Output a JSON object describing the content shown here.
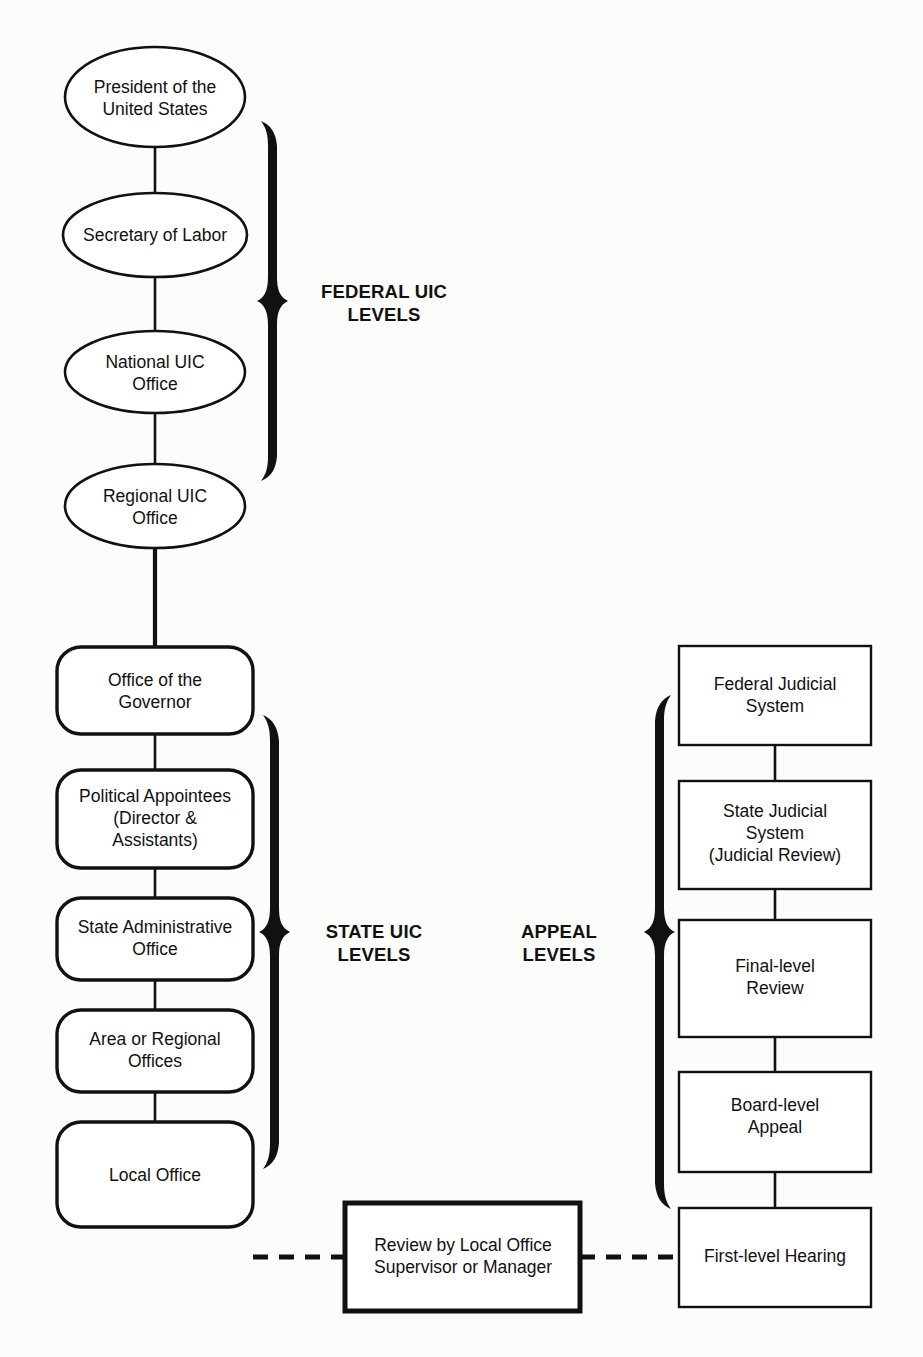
{
  "diagram": {
    "background_color": "#fcfcfb",
    "line_color": "#111111",
    "fill_color": "#ffffff"
  },
  "federal_column": {
    "group_label_line1": "FEDERAL UIC",
    "group_label_line2": "LEVELS",
    "nodes": [
      {
        "id": "president",
        "line1": "President of the",
        "line2": "United States",
        "shape": "ellipse"
      },
      {
        "id": "secretary-of-labor",
        "line1": "Secretary of Labor",
        "line2": "",
        "shape": "ellipse"
      },
      {
        "id": "national-uic-office",
        "line1": "National UIC",
        "line2": "Office",
        "shape": "ellipse"
      },
      {
        "id": "regional-uic-office",
        "line1": "Regional UIC",
        "line2": "Office",
        "shape": "ellipse"
      }
    ]
  },
  "state_column": {
    "group_label_line1": "STATE UIC",
    "group_label_line2": "LEVELS",
    "nodes": [
      {
        "id": "office-of-the-governor",
        "line1": "Office of the",
        "line2": "Governor",
        "line3": "",
        "shape": "rounded-rect"
      },
      {
        "id": "political-appointees",
        "line1": "Political Appointees",
        "line2": "(Director &",
        "line3": "Assistants)",
        "shape": "rounded-rect"
      },
      {
        "id": "state-administrative-office",
        "line1": "State Administrative",
        "line2": "Office",
        "line3": "",
        "shape": "rounded-rect"
      },
      {
        "id": "area-or-regional-offices",
        "line1": "Area or Regional",
        "line2": "Offices",
        "line3": "",
        "shape": "rounded-rect"
      },
      {
        "id": "local-office",
        "line1": "Local Office",
        "line2": "",
        "line3": "",
        "shape": "rounded-rect"
      }
    ]
  },
  "appeal_column": {
    "group_label_line1": "APPEAL",
    "group_label_line2": "LEVELS",
    "nodes": [
      {
        "id": "federal-judicial-system",
        "line1": "Federal Judicial",
        "line2": "System",
        "line3": "",
        "shape": "rect"
      },
      {
        "id": "state-judicial-system",
        "line1": "State Judicial",
        "line2": "System",
        "line3": "(Judicial Review)",
        "shape": "rect"
      },
      {
        "id": "final-level-review",
        "line1": "Final-level",
        "line2": "Review",
        "line3": "",
        "shape": "rect"
      },
      {
        "id": "board-level-appeal",
        "line1": "Board-level",
        "line2": "Appeal",
        "line3": "",
        "shape": "rect"
      },
      {
        "id": "first-level-hearing",
        "line1": "First-level Hearing",
        "line2": "",
        "line3": "",
        "shape": "rect"
      }
    ]
  },
  "bridge": {
    "review_box": {
      "id": "review-by-local-office-supervisor",
      "line1": "Review by Local Office",
      "line2": "Supervisor or Manager",
      "shape": "rect-heavy"
    },
    "left_connector_style": "dashed",
    "right_connector_style": "dashed"
  }
}
